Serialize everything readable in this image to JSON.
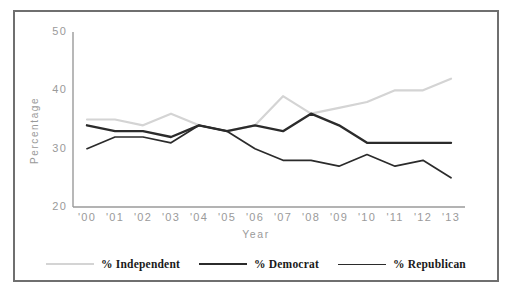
{
  "chart_data": {
    "type": "line",
    "title": "",
    "xlabel": "Year",
    "ylabel": "Percentage",
    "categories": [
      "'00",
      "'01",
      "'02",
      "'03",
      "'04",
      "'05",
      "'06",
      "'07",
      "'08",
      "'09",
      "'10",
      "'11",
      "'12",
      "'13"
    ],
    "ylim": [
      20,
      50
    ],
    "yticks": [
      20,
      30,
      40,
      50
    ],
    "ytick_labels": [
      "20",
      "30",
      "40",
      "50"
    ],
    "grid": false,
    "legend_position": "bottom",
    "series": [
      {
        "name": "% Independent",
        "color": "#d4d4d4",
        "width": 2.2,
        "values": [
          35,
          35,
          34,
          36,
          34,
          33,
          34,
          39,
          36,
          37,
          38,
          40,
          40,
          42
        ]
      },
      {
        "name": "% Democrat",
        "color": "#2b2b2b",
        "width": 2.4,
        "values": [
          34,
          33,
          33,
          32,
          34,
          33,
          34,
          33,
          36,
          34,
          31,
          31,
          31,
          31
        ]
      },
      {
        "name": "% Republican",
        "color": "#2b2b2b",
        "width": 1.7,
        "values": [
          30,
          32,
          32,
          31,
          34,
          33,
          30,
          28,
          28,
          27,
          29,
          27,
          28,
          25
        ]
      }
    ]
  },
  "axes": {
    "axis_color": "#9a9a9a",
    "tick_label_color": "#9a9a9a"
  },
  "frame": {
    "border_color": "#6f6f6f",
    "background": "#ffffff"
  },
  "legend": {
    "entries": [
      {
        "label": "% Independent",
        "color": "#d4d4d4",
        "width": 2.2
      },
      {
        "label": "% Democrat",
        "color": "#2b2b2b",
        "width": 2.6
      },
      {
        "label": "% Republican",
        "color": "#2b2b2b",
        "width": 1.7
      }
    ]
  }
}
